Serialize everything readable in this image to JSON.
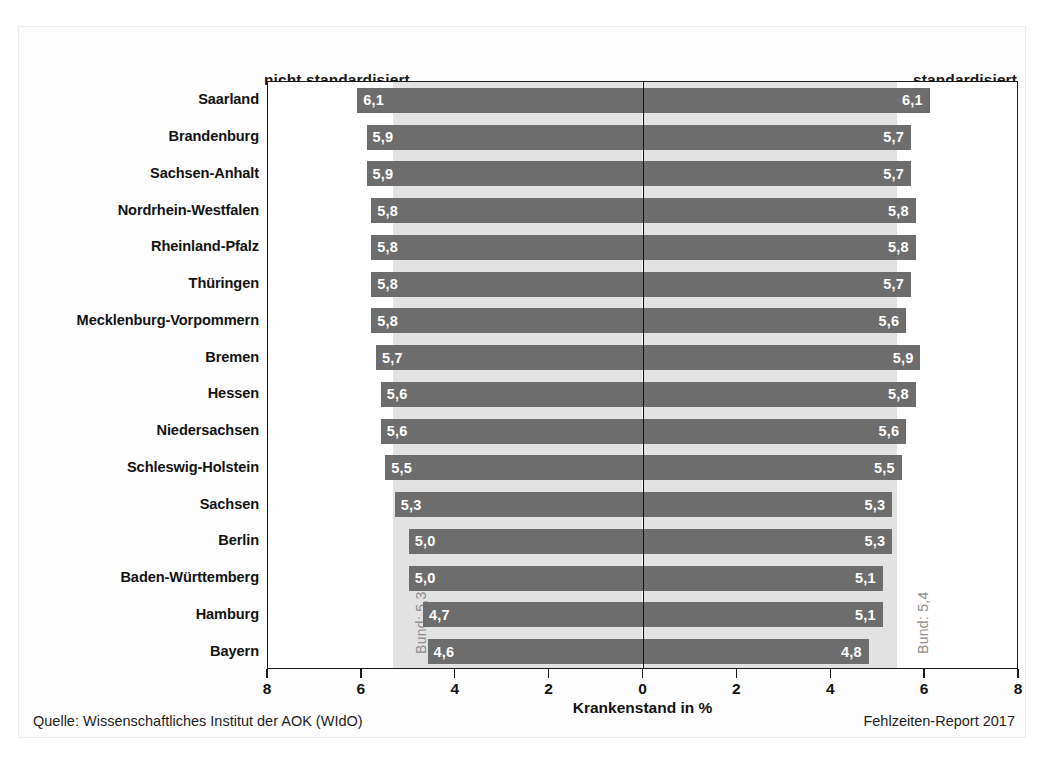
{
  "headers": {
    "left": "nicht standardisiert",
    "right": "standardisiert"
  },
  "axis": {
    "title": "Krankenstand in %",
    "ticks": [
      "8",
      "6",
      "4",
      "2",
      "0",
      "2",
      "4",
      "6",
      "8"
    ],
    "max": 8,
    "min": 0
  },
  "reference": {
    "left_label": "Bund: 5,3",
    "left_value": 5.3,
    "right_label": "Bund: 5,4",
    "right_value": 5.4
  },
  "footer": {
    "source": "Quelle: Wissenschaftliches Institut der AOK (WIdO)",
    "report": "Fehlzeiten-Report 2017"
  },
  "colors": {
    "bar": "#6d6d6d",
    "band": "#e2e2e2",
    "axis": "#1a1a1a",
    "value_text": "#ffffff",
    "band_text": "#8d8d8d"
  },
  "chart_data": {
    "type": "bar",
    "title": "",
    "subtitle": "",
    "xlabel": "Krankenstand in %",
    "ylabel": "",
    "orientation": "horizontal",
    "layout": "diverging-pyramid",
    "xlim": [
      0,
      8
    ],
    "grid": false,
    "legend_position": "top",
    "categories": [
      "Saarland",
      "Brandenburg",
      "Sachsen-Anhalt",
      "Nordrhein-Westfalen",
      "Rheinland-Pfalz",
      "Thüringen",
      "Mecklenburg-Vorpommern",
      "Bremen",
      "Hessen",
      "Niedersachsen",
      "Schleswig-Holstein",
      "Sachsen",
      "Berlin",
      "Baden-Württemberg",
      "Hamburg",
      "Bayern"
    ],
    "series": [
      {
        "name": "nicht standardisiert",
        "side": "left",
        "values": [
          6.1,
          5.9,
          5.9,
          5.8,
          5.8,
          5.8,
          5.8,
          5.7,
          5.6,
          5.6,
          5.5,
          5.3,
          5.0,
          5.0,
          4.7,
          4.6
        ],
        "labels": [
          "6,1",
          "5,9",
          "5,9",
          "5,8",
          "5,8",
          "5,8",
          "5,8",
          "5,7",
          "5,6",
          "5,6",
          "5,5",
          "5,3",
          "5,0",
          "5,0",
          "4,7",
          "4,6"
        ],
        "reference": 5.3,
        "reference_label": "Bund: 5,3"
      },
      {
        "name": "standardisiert",
        "side": "right",
        "values": [
          6.1,
          5.7,
          5.7,
          5.8,
          5.8,
          5.7,
          5.6,
          5.9,
          5.8,
          5.6,
          5.5,
          5.3,
          5.3,
          5.1,
          5.1,
          4.8
        ],
        "labels": [
          "6,1",
          "5,7",
          "5,7",
          "5,8",
          "5,8",
          "5,7",
          "5,6",
          "5,9",
          "5,8",
          "5,6",
          "5,5",
          "5,3",
          "5,3",
          "5,1",
          "5,1",
          "4,8"
        ],
        "reference": 5.4,
        "reference_label": "Bund: 5,4"
      }
    ],
    "annotations": [
      "Bund: 5,3",
      "Bund: 5,4",
      "Quelle: Wissenschaftliches Institut der AOK (WIdO)",
      "Fehlzeiten-Report 2017"
    ]
  }
}
